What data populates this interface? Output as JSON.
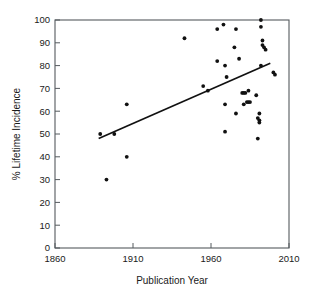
{
  "chart_data": {
    "type": "scatter",
    "title": "",
    "xlabel": "Publication Year",
    "ylabel": "% Lifetime Incidence",
    "xlim": [
      1860,
      2010
    ],
    "ylim": [
      0,
      100
    ],
    "xticks": [
      1860,
      1910,
      1960,
      2010
    ],
    "yticks": [
      0,
      10,
      20,
      30,
      40,
      50,
      60,
      70,
      80,
      90,
      100
    ],
    "xtick_labels": [
      "1860",
      "1910",
      "1960",
      "2010"
    ],
    "ytick_labels": [
      "0",
      "10",
      "20",
      "30",
      "40",
      "50",
      "60",
      "70",
      "80",
      "90",
      "100"
    ],
    "grid": false,
    "legend": "none",
    "marker": "filled-circle",
    "points": [
      {
        "x": 1889,
        "y": 50
      },
      {
        "x": 1893,
        "y": 30
      },
      {
        "x": 1898,
        "y": 50
      },
      {
        "x": 1906,
        "y": 63
      },
      {
        "x": 1906,
        "y": 40
      },
      {
        "x": 1943,
        "y": 92
      },
      {
        "x": 1955,
        "y": 71
      },
      {
        "x": 1958,
        "y": 69
      },
      {
        "x": 1964,
        "y": 96
      },
      {
        "x": 1964,
        "y": 82
      },
      {
        "x": 1968,
        "y": 98
      },
      {
        "x": 1969,
        "y": 80
      },
      {
        "x": 1970,
        "y": 75
      },
      {
        "x": 1969,
        "y": 63
      },
      {
        "x": 1969,
        "y": 51
      },
      {
        "x": 1976,
        "y": 96
      },
      {
        "x": 1975,
        "y": 88
      },
      {
        "x": 1978,
        "y": 83
      },
      {
        "x": 1976,
        "y": 59
      },
      {
        "x": 1980,
        "y": 68
      },
      {
        "x": 1981,
        "y": 68
      },
      {
        "x": 1982,
        "y": 68
      },
      {
        "x": 1984,
        "y": 69
      },
      {
        "x": 1983,
        "y": 64
      },
      {
        "x": 1981,
        "y": 63
      },
      {
        "x": 1984,
        "y": 64
      },
      {
        "x": 1985,
        "y": 64
      },
      {
        "x": 1989,
        "y": 67
      },
      {
        "x": 1992,
        "y": 100
      },
      {
        "x": 1992,
        "y": 97
      },
      {
        "x": 1993,
        "y": 91
      },
      {
        "x": 1993,
        "y": 89
      },
      {
        "x": 1994,
        "y": 88
      },
      {
        "x": 1995,
        "y": 87
      },
      {
        "x": 1992,
        "y": 80
      },
      {
        "x": 1991,
        "y": 59
      },
      {
        "x": 1990,
        "y": 57
      },
      {
        "x": 1991,
        "y": 56
      },
      {
        "x": 1991,
        "y": 55
      },
      {
        "x": 1990,
        "y": 48
      },
      {
        "x": 2000,
        "y": 77
      },
      {
        "x": 2001,
        "y": 76
      }
    ],
    "trend_line": {
      "name": "linear-regression",
      "x1": 1888,
      "y1": 48,
      "x2": 1998,
      "y2": 81
    }
  }
}
